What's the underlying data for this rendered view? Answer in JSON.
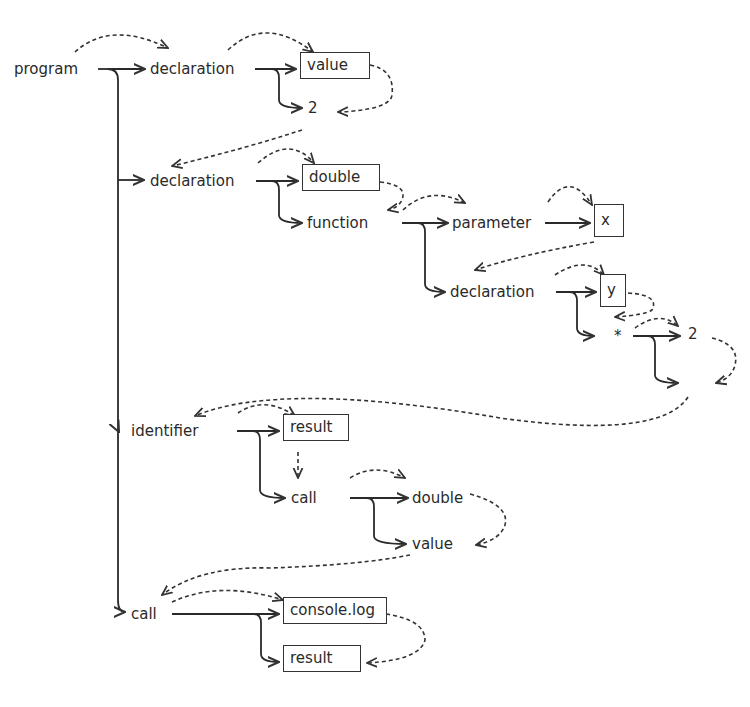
{
  "diagram": {
    "type": "syntax-tree-with-evaluation-order",
    "nodes": [
      {
        "id": "program",
        "label": "program",
        "boxed": false,
        "x": 14,
        "y": 65
      },
      {
        "id": "decl1",
        "label": "declaration",
        "boxed": false,
        "x": 150,
        "y": 65
      },
      {
        "id": "value_box",
        "label": "value",
        "boxed": true,
        "x": 300,
        "y": 54
      },
      {
        "id": "two1",
        "label": "2",
        "boxed": false,
        "x": 308,
        "y": 104
      },
      {
        "id": "decl2",
        "label": "declaration",
        "boxed": false,
        "x": 150,
        "y": 177
      },
      {
        "id": "double_box",
        "label": "double",
        "boxed": true,
        "x": 302,
        "y": 166
      },
      {
        "id": "function",
        "label": "function",
        "boxed": false,
        "x": 307,
        "y": 219
      },
      {
        "id": "parameter",
        "label": "parameter",
        "boxed": false,
        "x": 452,
        "y": 219
      },
      {
        "id": "x_box",
        "label": "x",
        "boxed": true,
        "x": 594,
        "y": 206
      },
      {
        "id": "decl3",
        "label": "declaration",
        "boxed": false,
        "x": 450,
        "y": 288
      },
      {
        "id": "y_box",
        "label": "y",
        "boxed": true,
        "x": 600,
        "y": 276
      },
      {
        "id": "star",
        "label": "*",
        "boxed": false,
        "x": 614,
        "y": 332
      },
      {
        "id": "two2",
        "label": "2",
        "boxed": false,
        "x": 688,
        "y": 330
      },
      {
        "id": "identifier",
        "label": "identifier",
        "boxed": false,
        "x": 131,
        "y": 427
      },
      {
        "id": "result_box1",
        "label": "result",
        "boxed": true,
        "x": 283,
        "y": 416
      },
      {
        "id": "call1",
        "label": "call",
        "boxed": false,
        "x": 291,
        "y": 494
      },
      {
        "id": "double2",
        "label": "double",
        "boxed": false,
        "x": 412,
        "y": 494
      },
      {
        "id": "value2",
        "label": "value",
        "boxed": false,
        "x": 412,
        "y": 540
      },
      {
        "id": "call2",
        "label": "call",
        "boxed": false,
        "x": 131,
        "y": 610
      },
      {
        "id": "console_box",
        "label": "console.log",
        "boxed": true,
        "x": 283,
        "y": 599
      },
      {
        "id": "result_box2",
        "label": "result",
        "boxed": true,
        "x": 283,
        "y": 647
      }
    ],
    "legend": {
      "solid_arrow": "tree edge (parent to child)",
      "dashed_arrow": "evaluation order"
    },
    "colors": {
      "ink": "#2a2a2a",
      "background": "#ffffff"
    }
  }
}
